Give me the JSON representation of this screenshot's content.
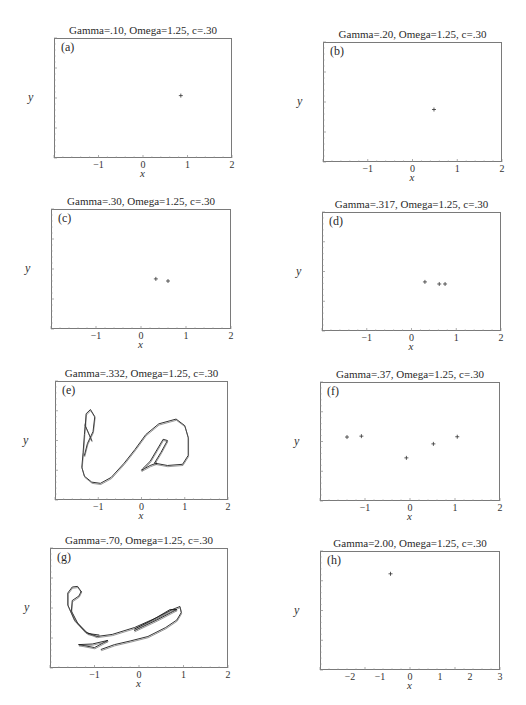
{
  "chart_data": [
    {
      "id": "a",
      "type": "scatter",
      "panel_label": "(a)",
      "title": "Gamma=.10, Omega=1.25, c=.30",
      "xlabel": "x",
      "ylabel": "y",
      "xlim": [
        -2,
        2
      ],
      "ylim": [
        -2,
        2
      ],
      "xticks": [
        "-1",
        "0",
        "1",
        "2"
      ],
      "yticks": [
        "2",
        "1",
        "0",
        "-1",
        "-2"
      ],
      "points": [
        [
          0.85,
          0.08
        ]
      ]
    },
    {
      "id": "b",
      "type": "scatter",
      "panel_label": "(b)",
      "title": "Gamma=.20, Omega=1.25, c=.30",
      "xlabel": "x",
      "ylabel": "y",
      "xlim": [
        -2,
        2
      ],
      "ylim": [
        -2,
        2
      ],
      "xticks": [
        "-1",
        "0",
        "1",
        "2"
      ],
      "yticks": [
        "2",
        "1",
        "0",
        "-1",
        "-2"
      ],
      "points": [
        [
          0.48,
          -0.25
        ]
      ]
    },
    {
      "id": "c",
      "type": "scatter",
      "panel_label": "(c)",
      "title": "Gamma=.30, Omega=1.25, c=.30",
      "xlabel": "x",
      "ylabel": "y",
      "xlim": [
        -2,
        2
      ],
      "ylim": [
        -2,
        2
      ],
      "xticks": [
        "-1",
        "0",
        "1",
        "2"
      ],
      "yticks": [
        "2",
        "1",
        "0",
        "-1",
        "-2"
      ],
      "points": [
        [
          0.33,
          -0.33
        ],
        [
          0.6,
          -0.4
        ]
      ]
    },
    {
      "id": "d",
      "type": "scatter",
      "panel_label": "(d)",
      "title": "Gamma=.317, Omega=1.25, c=.30",
      "xlabel": "x",
      "ylabel": "y",
      "xlim": [
        -2,
        2
      ],
      "ylim": [
        -2,
        2
      ],
      "xticks": [
        "-1",
        "0",
        "1",
        "2"
      ],
      "yticks": [
        "2",
        "1",
        "0",
        "-1",
        "-2"
      ],
      "points": [
        [
          0.3,
          -0.35
        ],
        [
          0.62,
          -0.42
        ],
        [
          0.75,
          -0.42
        ]
      ]
    },
    {
      "id": "e",
      "type": "line",
      "panel_label": "(e)",
      "title": "Gamma=.332, Omega=1.25, c=.30",
      "xlabel": "x",
      "ylabel": "y",
      "xlim": [
        -2,
        2
      ],
      "ylim": [
        -1,
        1
      ],
      "xticks": [
        "-1",
        "0",
        "1",
        "2"
      ],
      "yticks": [
        "1",
        "0.8",
        "0.6",
        "0.4",
        "0.2",
        "0",
        "-0.2",
        "-0.4",
        "-0.6",
        "-0.8",
        "-1"
      ],
      "description": "Strange attractor (Poincare section) — S-shaped curve",
      "curves": [
        [
          [
            -1.3,
            0.28
          ],
          [
            -1.32,
            0.1
          ],
          [
            -1.35,
            -0.2
          ],
          [
            -1.38,
            -0.45
          ],
          [
            -1.32,
            -0.6
          ],
          [
            -1.15,
            -0.7
          ],
          [
            -0.95,
            -0.72
          ],
          [
            -0.7,
            -0.62
          ],
          [
            -0.4,
            -0.38
          ],
          [
            -0.15,
            -0.15
          ],
          [
            0.1,
            0.1
          ],
          [
            0.4,
            0.28
          ],
          [
            0.8,
            0.36
          ],
          [
            1.0,
            0.25
          ],
          [
            1.08,
            0.05
          ],
          [
            1.08,
            -0.25
          ],
          [
            0.95,
            -0.4
          ],
          [
            0.6,
            -0.42
          ],
          [
            0.3,
            -0.38
          ],
          [
            0.45,
            -0.2
          ],
          [
            0.6,
            0.0
          ],
          [
            0.5,
            0.02
          ],
          [
            0.2,
            -0.35
          ],
          [
            0.02,
            -0.48
          ],
          [
            0.0,
            -0.5
          ],
          [
            0.2,
            -0.42
          ],
          [
            0.35,
            -0.38
          ]
        ],
        [
          [
            -1.15,
            0.0
          ],
          [
            -1.3,
            0.25
          ],
          [
            -1.28,
            0.45
          ],
          [
            -1.18,
            0.52
          ],
          [
            -1.08,
            0.4
          ],
          [
            -1.12,
            0.15
          ],
          [
            -1.25,
            -0.05
          ],
          [
            -1.32,
            -0.25
          ]
        ]
      ]
    },
    {
      "id": "f",
      "type": "scatter",
      "panel_label": "(f)",
      "title": "Gamma=.37, Omega=1.25, c=.30",
      "xlabel": "x",
      "ylabel": "y",
      "xlim": [
        -2,
        2
      ],
      "ylim": [
        -2,
        2
      ],
      "xticks": [
        "-1",
        "0",
        "1",
        "2"
      ],
      "yticks": [
        "2",
        "1",
        "0",
        "-1",
        "-2"
      ],
      "points": [
        [
          -1.4,
          0.15
        ],
        [
          -1.08,
          0.18
        ],
        [
          -0.08,
          -0.55
        ],
        [
          0.52,
          -0.08
        ],
        [
          1.05,
          0.16
        ]
      ]
    },
    {
      "id": "g",
      "type": "line",
      "panel_label": "(g)",
      "title": "Gamma=.70, Omega=1.25, c=.30",
      "xlabel": "x",
      "ylabel": "y",
      "xlim": [
        -2,
        2
      ],
      "ylim": [
        -2,
        2
      ],
      "xticks": [
        "-1",
        "0",
        "1",
        "2"
      ],
      "yticks": [
        "2",
        "1",
        "0",
        "-1",
        "-2"
      ],
      "description": "Strange attractor (Poincare section) — hook-shaped band",
      "curves": [
        [
          [
            -1.3,
            0.55
          ],
          [
            -1.38,
            0.72
          ],
          [
            -1.5,
            0.7
          ],
          [
            -1.6,
            0.5
          ],
          [
            -1.6,
            0.1
          ],
          [
            -1.45,
            -0.4
          ],
          [
            -1.2,
            -0.8
          ],
          [
            -0.95,
            -0.95
          ],
          [
            -0.6,
            -0.88
          ],
          [
            -0.1,
            -0.65
          ],
          [
            0.4,
            -0.32
          ],
          [
            0.75,
            -0.05
          ],
          [
            0.92,
            0.05
          ],
          [
            0.95,
            -0.15
          ],
          [
            0.85,
            -0.4
          ],
          [
            0.6,
            -0.65
          ],
          [
            0.2,
            -0.95
          ],
          [
            -0.2,
            -1.1
          ],
          [
            -0.55,
            -1.22
          ],
          [
            -0.85,
            -1.38
          ]
        ],
        [
          [
            -1.3,
            0.55
          ],
          [
            -1.35,
            0.4
          ],
          [
            -1.5,
            0.25
          ],
          [
            -1.52,
            -0.1
          ],
          [
            -1.38,
            -0.5
          ],
          [
            -1.15,
            -0.85
          ],
          [
            -0.9,
            -0.9
          ]
        ],
        [
          [
            -1.35,
            -1.22
          ],
          [
            -1.0,
            -1.32
          ],
          [
            -0.7,
            -1.08
          ],
          [
            -1.05,
            -1.2
          ],
          [
            -1.35,
            -1.22
          ]
        ],
        [
          [
            -0.1,
            -0.75
          ],
          [
            0.4,
            -0.4
          ],
          [
            0.85,
            -0.05
          ],
          [
            0.7,
            -0.05
          ],
          [
            0.3,
            -0.4
          ],
          [
            -0.1,
            -0.7
          ]
        ]
      ]
    },
    {
      "id": "h",
      "type": "scatter",
      "panel_label": "(h)",
      "title": "Gamma=2.00, Omega=1.25, c=.30",
      "xlabel": "x",
      "ylabel": "y",
      "xlim": [
        -3,
        3
      ],
      "ylim": [
        -3,
        3
      ],
      "xticks": [
        "-2",
        "-1",
        "0",
        "1",
        "2",
        "3"
      ],
      "yticks": [
        "3",
        "2",
        "1",
        "0",
        "-1",
        "-2",
        "-3"
      ],
      "points": [
        [
          -0.65,
          1.85
        ]
      ]
    }
  ],
  "layout": {
    "a": {
      "left": 54,
      "top": 38,
      "width": 178,
      "height": 120
    },
    "b": {
      "left": 323,
      "top": 42,
      "width": 179,
      "height": 120
    },
    "c": {
      "left": 51,
      "top": 209,
      "width": 180,
      "height": 120
    },
    "d": {
      "left": 322,
      "top": 212,
      "width": 179,
      "height": 119
    },
    "e": {
      "left": 55,
      "top": 381,
      "width": 173,
      "height": 119
    },
    "f": {
      "left": 320,
      "top": 382,
      "width": 180,
      "height": 119
    },
    "g": {
      "left": 50,
      "top": 548,
      "width": 178,
      "height": 120
    },
    "h": {
      "left": 320,
      "top": 551,
      "width": 180,
      "height": 119
    }
  },
  "colors": {
    "frame": "#7a7a7a",
    "ink": "#222222",
    "background": "#ffffff"
  }
}
